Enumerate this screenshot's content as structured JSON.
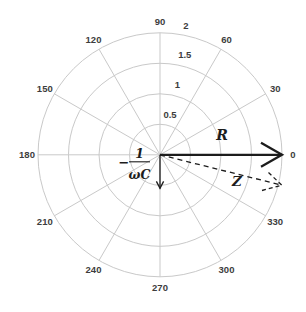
{
  "figure": {
    "background": "#ffffff"
  },
  "chart_data": {
    "type": "polar-vector",
    "title": "",
    "angle_unit": "degrees",
    "angle_tick_step_deg": 30,
    "angle_tick_labels": [
      "0",
      "30",
      "60",
      "90",
      "120",
      "150",
      "180",
      "210",
      "240",
      "270",
      "300",
      "330"
    ],
    "radial_ticks": [
      {
        "value": 0.5,
        "label": "0.5"
      },
      {
        "value": 1,
        "label": "1"
      },
      {
        "value": 1.5,
        "label": "1.5"
      },
      {
        "value": 2,
        "label": "2"
      }
    ],
    "r_max": 2,
    "grid": true,
    "legend_position": "none",
    "series": [
      {
        "name": "R",
        "label": "R",
        "magnitude": 2.0,
        "angle_deg": 0,
        "line_style": "solid",
        "weight": "thick"
      },
      {
        "name": "Z",
        "label": "Z",
        "magnitude": 2.06,
        "angle_deg": -14,
        "line_style": "dashed",
        "weight": "thin"
      },
      {
        "name": "capacitive-reactance",
        "label_minus": "−",
        "label_numerator": "1",
        "label_denominator": "ωC",
        "magnitude": 0.55,
        "angle_deg": 270,
        "line_style": "solid",
        "weight": "thin"
      }
    ],
    "colors": {
      "grid": "#c9c9c9",
      "tick_text": "#3d3d3d",
      "vector": "#1c1c1c",
      "background": "#ffffff"
    }
  }
}
